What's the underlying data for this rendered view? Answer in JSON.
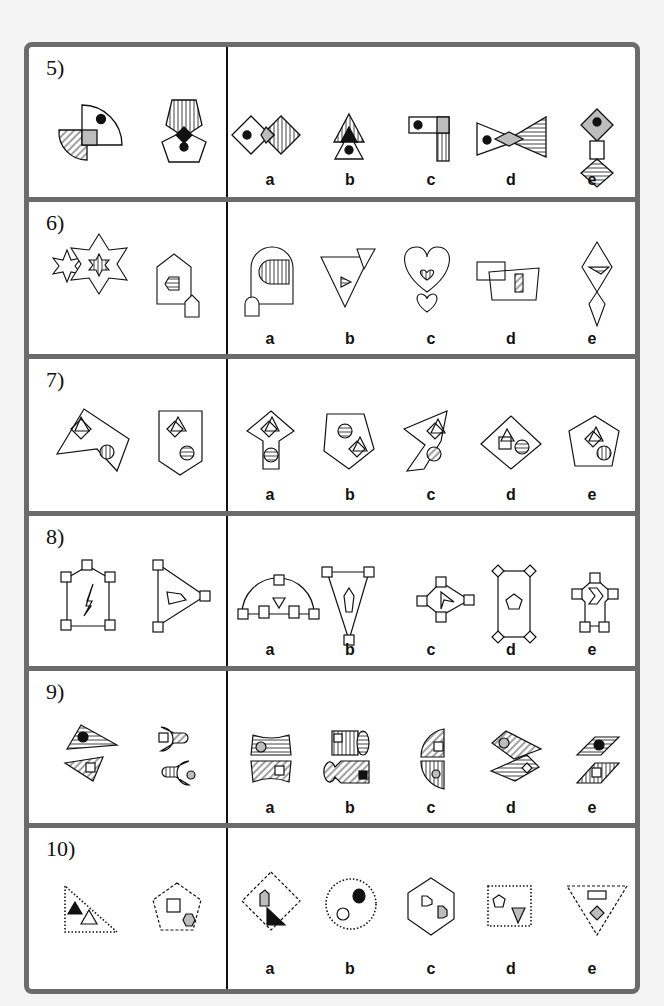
{
  "puzzle_sheet": {
    "questions": [
      {
        "number": "5)",
        "options": [
          "a",
          "b",
          "c",
          "d",
          "e"
        ]
      },
      {
        "number": "6)",
        "options": [
          "a",
          "b",
          "c",
          "d",
          "e"
        ]
      },
      {
        "number": "7)",
        "options": [
          "a",
          "b",
          "c",
          "d",
          "e"
        ]
      },
      {
        "number": "8)",
        "options": [
          "a",
          "b",
          "c",
          "d",
          "e"
        ]
      },
      {
        "number": "9)",
        "options": [
          "a",
          "b",
          "c",
          "d",
          "e"
        ]
      },
      {
        "number": "10)",
        "options": [
          "a",
          "b",
          "c",
          "d",
          "e"
        ]
      }
    ]
  },
  "colors": {
    "border": "#6b6b6b",
    "gray_fill": "#bdbdbd",
    "ink": "#111111"
  }
}
